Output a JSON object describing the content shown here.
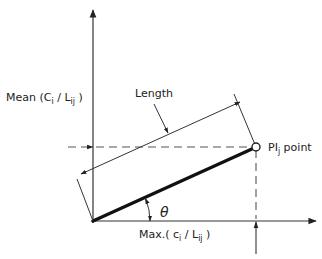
{
  "diagram": {
    "y_axis_label": {
      "main": "Mean (C",
      "sub1": "i",
      "mid": " / L",
      "sub2": "ij",
      "end": " )"
    },
    "x_axis_label": {
      "main": "Max.( c",
      "sub1": "i",
      "mid": " / L",
      "sub2": "ij",
      "end": " )"
    },
    "length_label": "Length",
    "angle_label": "θ",
    "point_label": {
      "main": "PI",
      "sub": "j",
      "end": " point"
    },
    "colors": {
      "line": "#222222",
      "dashed": "#555555",
      "background": "#ffffff"
    }
  }
}
